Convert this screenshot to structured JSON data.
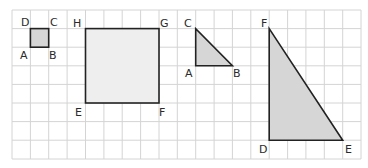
{
  "grid": {
    "x0": 12,
    "y0": 10,
    "cols": 19,
    "rows": 8,
    "cell_w": 18.37,
    "cell_h": 18.6,
    "line_color": "#d4d4d4"
  },
  "colors": {
    "stroke": "#222222",
    "fill": "#d6d6d6",
    "fill_light": "#eeeeee"
  },
  "shapes": {
    "small_square": {
      "labels": {
        "D": "D",
        "C": "C",
        "B": "B",
        "A": "A"
      }
    },
    "large_square": {
      "labels": {
        "H": "H",
        "G": "G",
        "F": "F",
        "E": "E"
      }
    },
    "small_triangle": {
      "labels": {
        "C": "C",
        "A": "A",
        "B": "B"
      }
    },
    "large_triangle": {
      "labels": {
        "F": "F",
        "D": "D",
        "E": "E"
      }
    }
  }
}
